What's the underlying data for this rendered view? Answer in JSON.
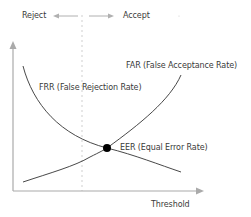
{
  "diagram": {
    "title": "",
    "direction_labels": {
      "reject": "Reject",
      "accept": "Accept"
    },
    "curves": {
      "far": {
        "label": "FAR (False Acceptance Rate)",
        "color": "#333333"
      },
      "frr": {
        "label": "FRR (False Rejection Rate)",
        "color": "#333333"
      }
    },
    "eer": {
      "label": "EER (Equal Error Rate)",
      "color": "#000000"
    },
    "axes": {
      "x_label": "Threshold",
      "y_label": "",
      "axis_color": "#aaaaaa"
    },
    "threshold_line": {
      "style": "dashed",
      "color": "#cccccc"
    }
  }
}
